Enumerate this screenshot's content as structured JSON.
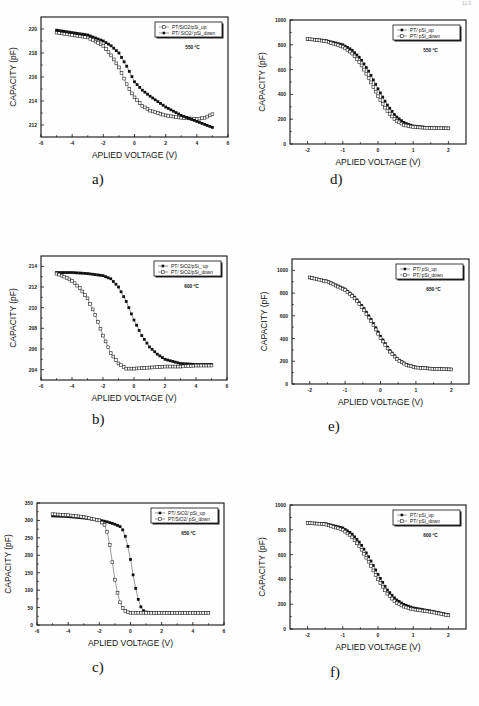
{
  "page": {
    "page_number": "113"
  },
  "chart_data": [
    {
      "id": "a",
      "caption": "a)",
      "type": "scatter",
      "title": "",
      "annotation": "550 ºC",
      "xlabel": "APLIED VOLTAGE (V)",
      "ylabel": "CAPACITY (pF)",
      "xlim": [
        -6,
        6
      ],
      "ylim": [
        211,
        221
      ],
      "xticks": [
        -6,
        -4,
        -2,
        0,
        2,
        4,
        6
      ],
      "yticks": [
        212,
        214,
        216,
        218,
        220
      ],
      "legend_position": "upper right",
      "grid": false,
      "series": [
        {
          "name": "PT/SiO2/pSi_up",
          "marker": "open-square",
          "x": [
            -5,
            -4,
            -3,
            -2,
            -1.5,
            -1,
            -0.75,
            -0.5,
            -0.25,
            0,
            0.5,
            1,
            2,
            3,
            4,
            4.5,
            5
          ],
          "y": [
            219.7,
            219.5,
            219.3,
            218.6,
            217.8,
            216.8,
            216.1,
            215.4,
            214.8,
            214.3,
            213.6,
            213.2,
            212.8,
            212.6,
            212.5,
            212.6,
            212.9
          ]
        },
        {
          "name": "PT/ SiO2/ pSi_down",
          "marker": "filled-square",
          "x": [
            -5,
            -4,
            -3,
            -2,
            -1.5,
            -1,
            -0.5,
            0,
            0.5,
            1,
            2,
            3,
            4,
            5
          ],
          "y": [
            219.9,
            219.7,
            219.5,
            219.0,
            218.6,
            218.0,
            216.9,
            215.6,
            214.9,
            214.4,
            213.5,
            212.8,
            212.3,
            211.8
          ]
        }
      ]
    },
    {
      "id": "b",
      "caption": "b)",
      "type": "scatter",
      "title": "",
      "annotation": "600 ºC",
      "xlabel": "APLIED VOLTAGE (V)",
      "ylabel": "CAPACITY (pF)",
      "xlim": [
        -6,
        6
      ],
      "ylim": [
        203,
        215
      ],
      "xticks": [
        -6,
        -4,
        -2,
        0,
        2,
        4,
        6
      ],
      "yticks": [
        204,
        206,
        208,
        210,
        212,
        214
      ],
      "legend_position": "upper right",
      "grid": false,
      "series": [
        {
          "name": "PT/ SiO2/pSi_ up",
          "marker": "filled-square",
          "x": [
            -5,
            -4,
            -3,
            -2,
            -1.5,
            -1,
            -0.5,
            0,
            0.5,
            1,
            1.5,
            2,
            3,
            4,
            5
          ],
          "y": [
            213.4,
            213.4,
            213.3,
            213.1,
            212.8,
            212.0,
            210.6,
            208.8,
            207.3,
            206.2,
            205.5,
            205.0,
            204.6,
            204.5,
            204.5
          ]
        },
        {
          "name": "PT/ SiO2/pSi_down",
          "marker": "open-square",
          "x": [
            -5,
            -4.5,
            -4,
            -3.5,
            -3,
            -2.5,
            -2,
            -1.5,
            -1,
            -0.5,
            0,
            1,
            2,
            3,
            4,
            5
          ],
          "y": [
            213.3,
            213.0,
            212.6,
            211.9,
            210.9,
            209.3,
            207.3,
            205.6,
            204.6,
            204.1,
            204.1,
            204.2,
            204.3,
            204.3,
            204.4,
            204.4
          ]
        }
      ]
    },
    {
      "id": "c",
      "caption": "c)",
      "type": "scatter",
      "title": "",
      "annotation": "650 ºC",
      "xlabel": "APLIED VOLTAGE (V)",
      "ylabel": "CAPACITY (pF)",
      "xlim": [
        -6,
        6
      ],
      "ylim": [
        0,
        350
      ],
      "xticks": [
        -6,
        -4,
        -2,
        0,
        2,
        4,
        6
      ],
      "yticks": [
        0,
        50,
        100,
        150,
        200,
        250,
        300,
        350
      ],
      "legend_position": "upper right",
      "grid": false,
      "series": [
        {
          "name": "PT/ SiO2/ pSi_up",
          "marker": "filled-square",
          "x": [
            -5,
            -4,
            -3,
            -2,
            -1.5,
            -1,
            -0.6,
            -0.4,
            -0.2,
            0,
            0.2,
            0.4,
            0.6,
            0.8,
            1,
            1.5,
            2,
            3,
            4,
            5
          ],
          "y": [
            313,
            311,
            307,
            301,
            296,
            289,
            281,
            265,
            233,
            188,
            135,
            90,
            57,
            42,
            37,
            35,
            35,
            35,
            35,
            35
          ]
        },
        {
          "name": "PT/SiO2/ pSi_down",
          "marker": "open-square",
          "x": [
            -5,
            -4,
            -3,
            -2,
            -1.6,
            -1.4,
            -1.2,
            -1.0,
            -0.8,
            -0.6,
            -0.4,
            -0.2,
            0,
            1,
            2,
            3,
            4,
            5
          ],
          "y": [
            318,
            315,
            310,
            300,
            285,
            250,
            190,
            130,
            85,
            55,
            42,
            37,
            35,
            35,
            35,
            35,
            35,
            35
          ]
        }
      ]
    },
    {
      "id": "d",
      "caption": "d)",
      "type": "scatter",
      "title": "",
      "annotation": "550 ºC",
      "xlabel": "APLIED VOLTAGE (V)",
      "ylabel": "CAPACITY (pF)",
      "xlim": [
        -2.5,
        2.5
      ],
      "ylim": [
        0,
        1000
      ],
      "xticks": [
        -2,
        -1,
        0,
        1,
        2
      ],
      "yticks": [
        0,
        200,
        400,
        600,
        800,
        1000
      ],
      "legend_position": "upper right",
      "grid": false,
      "series": [
        {
          "name": "PT/ pSi_up",
          "marker": "filled-square",
          "x": [
            -2,
            -1.5,
            -1,
            -0.75,
            -0.5,
            -0.25,
            0,
            0.25,
            0.5,
            0.75,
            1,
            1.5,
            2
          ],
          "y": [
            845,
            835,
            800,
            760,
            690,
            580,
            445,
            320,
            225,
            170,
            145,
            130,
            128
          ]
        },
        {
          "name": "PT/ pSi_down",
          "marker": "open-square",
          "x": [
            -2,
            -1.5,
            -1,
            -0.75,
            -0.5,
            -0.25,
            0,
            0.25,
            0.5,
            0.75,
            1,
            1.5,
            2
          ],
          "y": [
            848,
            830,
            785,
            735,
            650,
            525,
            385,
            270,
            190,
            152,
            137,
            128,
            126
          ]
        }
      ]
    },
    {
      "id": "e",
      "caption": "e)",
      "type": "scatter",
      "title": "",
      "annotation": "650 ºC",
      "xlabel": "APLIED VOLTAGE (V)",
      "ylabel": "CAPACITY (pF)",
      "xlim": [
        -2.5,
        2.5
      ],
      "ylim": [
        0,
        1100
      ],
      "xticks": [
        -2,
        -1,
        0,
        1,
        2
      ],
      "yticks": [
        0,
        200,
        400,
        600,
        800,
        1000
      ],
      "legend_position": "upper right",
      "grid": false,
      "series": [
        {
          "name": "PT/ pSi_up",
          "marker": "filled-square",
          "x": [
            -2,
            -1.5,
            -1,
            -0.75,
            -0.5,
            -0.25,
            0,
            0.25,
            0.5,
            0.75,
            1,
            1.5,
            2
          ],
          "y": [
            935,
            905,
            835,
            770,
            680,
            560,
            420,
            300,
            215,
            170,
            148,
            135,
            130
          ]
        },
        {
          "name": "PT/ pSi_down",
          "marker": "open-square",
          "x": [
            -2,
            -1.5,
            -1,
            -0.75,
            -0.5,
            -0.25,
            0,
            0.25,
            0.5,
            0.75,
            1,
            1.5,
            2
          ],
          "y": [
            938,
            900,
            828,
            760,
            665,
            545,
            405,
            290,
            208,
            165,
            145,
            133,
            128
          ]
        }
      ]
    },
    {
      "id": "f",
      "caption": "f)",
      "type": "scatter",
      "title": "",
      "annotation": "600 ºC",
      "xlabel": "APLIED VOLTAGE (V)",
      "ylabel": "CAPACITY (pF)",
      "xlim": [
        -2.5,
        2.5
      ],
      "ylim": [
        0,
        1000
      ],
      "xticks": [
        -2,
        -1,
        0,
        1,
        2
      ],
      "yticks": [
        0,
        200,
        400,
        600,
        800,
        1000
      ],
      "legend_position": "upper right",
      "grid": false,
      "series": [
        {
          "name": "PT/ pSi_up",
          "marker": "filled-square",
          "x": [
            -2,
            -1.5,
            -1,
            -0.75,
            -0.5,
            -0.25,
            0,
            0.25,
            0.5,
            0.75,
            1,
            1.5,
            2
          ],
          "y": [
            855,
            850,
            815,
            770,
            690,
            575,
            440,
            320,
            240,
            195,
            170,
            145,
            115
          ]
        },
        {
          "name": "PT/ pSi_down",
          "marker": "open-square",
          "x": [
            -2,
            -1.5,
            -1,
            -0.75,
            -0.5,
            -0.25,
            0,
            0.25,
            0.5,
            0.75,
            1,
            1.5,
            2
          ],
          "y": [
            855,
            845,
            800,
            745,
            655,
            535,
            400,
            290,
            215,
            178,
            158,
            138,
            110
          ]
        }
      ]
    }
  ]
}
